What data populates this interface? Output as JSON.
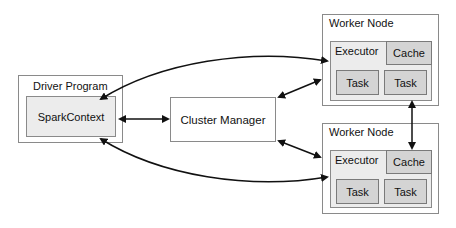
{
  "driver": {
    "title": "Driver Program",
    "context": "SparkContext"
  },
  "cluster_manager": {
    "label": "Cluster Manager"
  },
  "workers": [
    {
      "title": "Worker Node",
      "executor": "Executor",
      "cache": "Cache",
      "tasks": [
        "Task",
        "Task"
      ]
    },
    {
      "title": "Worker Node",
      "executor": "Executor",
      "cache": "Cache",
      "tasks": [
        "Task",
        "Task"
      ]
    }
  ],
  "colors": {
    "border": "#8a8a8a",
    "inner_fill": "#ececec",
    "cell_fill": "#d4d4d4",
    "arrow": "#111111"
  }
}
